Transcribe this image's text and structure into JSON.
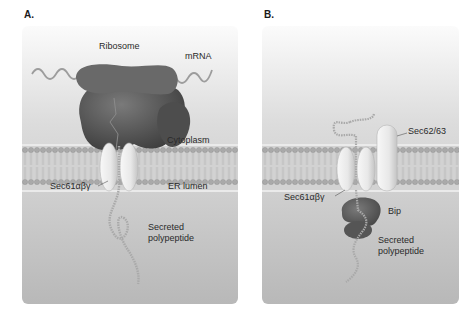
{
  "figure": {
    "panels": [
      {
        "id": "A",
        "label": "A.",
        "labels": {
          "ribosome": "Ribosome",
          "mrna": "mRNA",
          "cytoplasm": "Cytoplasm",
          "translocon": "Sec61αβγ",
          "er_lumen": "ER lumen",
          "secreted_line1": "Secreted",
          "secreted_line2": "polypeptide"
        }
      },
      {
        "id": "B",
        "label": "B.",
        "labels": {
          "sec62_63": "Sec62/63",
          "translocon": "Sec61αβγ",
          "bip": "Bip",
          "secreted_line1": "Secreted",
          "secreted_line2": "polypeptide"
        }
      }
    ],
    "colors": {
      "background_top": "#f4f4f4",
      "background_bottom": "#bdbdbd",
      "membrane": "#c8c8c8",
      "lipid_head": "#a8a8a8",
      "ribosome": "#5a5a5a",
      "translocon": "#eeeeee",
      "bip": "#606060",
      "polypeptide": "#bcbcbc",
      "mrna": "#9a9a9a"
    }
  }
}
